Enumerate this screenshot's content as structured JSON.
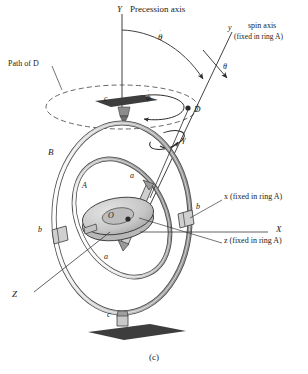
{
  "figure": {
    "caption": "(c)",
    "title_axis": "Precession axis",
    "labels": {
      "Y_axis": "Y",
      "X_axis": "X",
      "Z_axis": "Z",
      "precession_axis": "Precession axis",
      "path_of_D": "Path of D",
      "spin_axis_line1": "spin axis",
      "spin_axis_line2": "(fixed in ring A)",
      "y_small": "y",
      "theta": "θ",
      "theta_dot_base": "θ",
      "phi_dot_base": "ϕ",
      "gamma_dot_base": "γ",
      "dot_mark": "˙",
      "point_D": "D",
      "point_O": "O",
      "ring_A": "A",
      "ring_B": "B",
      "bearing_a_top": "a",
      "bearing_a_bottom": "a",
      "bearing_b_right": "b",
      "bearing_b_left": "b",
      "bearing_c_top": "c",
      "bearing_c_bottom": "c",
      "x_fixed": "x (fixed in ring A)",
      "z_fixed": "z (fixed in ring A)"
    },
    "colors": {
      "ink": "#1a1a1a",
      "ring_fill": "#d9d9d9",
      "ring_stroke": "#4a4a4a",
      "rotor_fill": "#c9c9c9",
      "pedestal": "#4f4f4f",
      "line": "#3a3a3a",
      "dashed": "#555555"
    }
  }
}
